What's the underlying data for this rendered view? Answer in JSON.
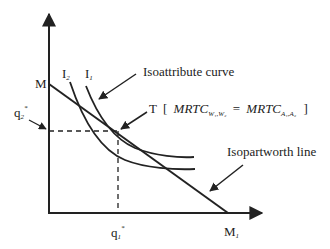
{
  "diagram": {
    "type": "economics-tangency-diagram",
    "axes": {
      "vertical_axis_label": "",
      "horizontal_axis_label": ""
    },
    "points": {
      "y_intercept": "M",
      "x_intercept": "M",
      "x_intercept_sub": "1",
      "tangency": "T"
    },
    "curve_labels": {
      "inner_curve": "I",
      "inner_curve_sub": "2",
      "outer_curve": "I",
      "outer_curve_sub": "1"
    },
    "annotations": {
      "isoattribute": "Isoattribute curve",
      "isopartworth": "Isopartworth line",
      "condition_open": "[",
      "condition_lhs": "MRTC",
      "condition_lhs_sub": "W₁,W₂",
      "condition_eq": "=",
      "condition_rhs": "MRTC",
      "condition_rhs_sub": "A₁,A₂",
      "condition_close": "]"
    },
    "optimal_values": {
      "q1": "q",
      "q1_sub": "1",
      "q1_sup": "*",
      "q2": "q",
      "q2_sub": "2",
      "q2_sup": "*"
    },
    "colors": {
      "ink": "#222222",
      "background": "#ffffff"
    }
  }
}
